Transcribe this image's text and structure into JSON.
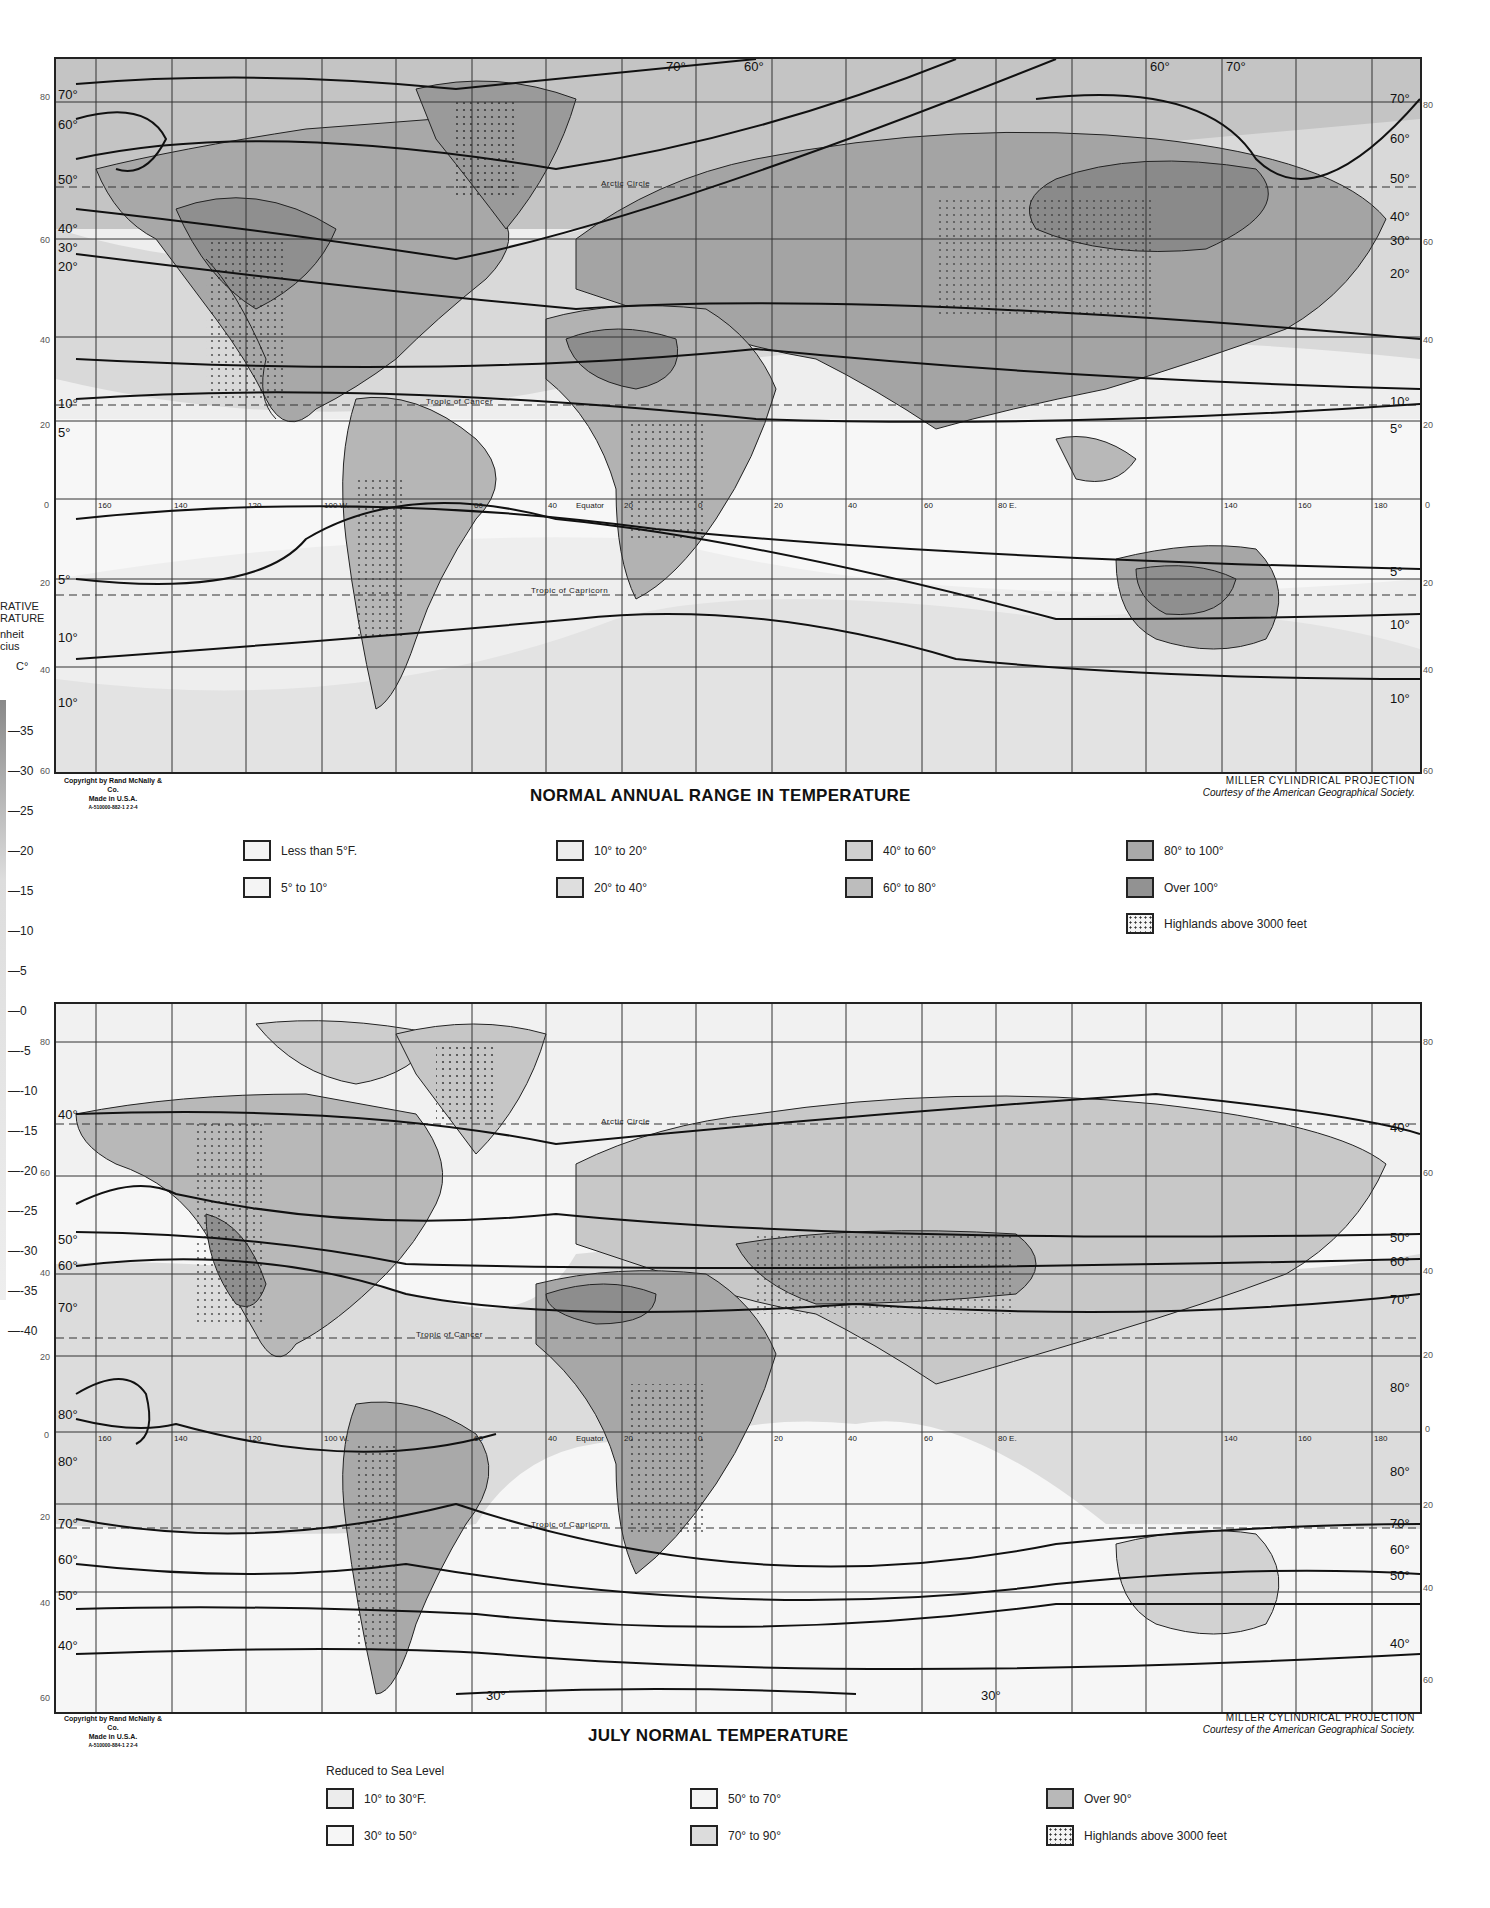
{
  "side_scale": {
    "header_lines": [
      "RATIVE",
      "RATURE",
      "nheit",
      "cius"
    ],
    "unit": "C°",
    "ticks": [
      "35",
      "30",
      "25",
      "20",
      "15",
      "10",
      "5",
      "0",
      "-5",
      "-10",
      "-15",
      "-20",
      "-25",
      "-30",
      "-35",
      "-40"
    ]
  },
  "colors": {
    "level_1": "#f4f4f4",
    "level_2": "#ececec",
    "level_3": "#dedede",
    "level_4": "#cfcfcf",
    "level_5": "#bdbdbd",
    "level_6": "#a9a9a9",
    "level_7": "#929292",
    "line": "#1a1a1a"
  },
  "maps": [
    {
      "title": "NORMAL ANNUAL RANGE IN TEMPERATURE",
      "copyright": [
        "Copyright by Rand McNally & Co.",
        "Made in U.S.A.",
        "A-510000-882-1 2 2-4"
      ],
      "projection": "MILLER CYLINDRICAL PROJECTION",
      "courtesy": "Courtesy of the American Geographical Society.",
      "lat_labels_left": [
        "80",
        "60",
        "40",
        "20",
        "0",
        "20",
        "40",
        "60"
      ],
      "lat_labels_right": [
        "80",
        "60",
        "40",
        "20",
        "0",
        "20",
        "40",
        "60"
      ],
      "lon_labels": [
        "160",
        "140",
        "120",
        "100 W.",
        "60",
        "40",
        "Equator",
        "20",
        "0",
        "20",
        "40",
        "60",
        "80 E.",
        "140",
        "160",
        "180"
      ],
      "reference_lines": {
        "arctic": "Arctic Circle",
        "cancer": "Tropic of Cancer",
        "capricorn": "Tropic of Capricorn"
      },
      "isotherm_labels_left": [
        "70°",
        "60°",
        "50°",
        "40°",
        "30°",
        "20°",
        "10°",
        "5°",
        "5°",
        "10°",
        "10°"
      ],
      "isotherm_labels_right": [
        "70°",
        "60°",
        "50°",
        "40°",
        "30°",
        "20°",
        "10°",
        "5°",
        "5°",
        "10°",
        "10°"
      ],
      "isotherm_labels_top": [
        "70°",
        "60°",
        "60°",
        "70°"
      ],
      "legend": [
        {
          "label": "Less than 5°F.",
          "level": 1
        },
        {
          "label": "5° to 10°",
          "level": 1
        },
        {
          "label": "10° to 20°",
          "level": 2
        },
        {
          "label": "20° to 40°",
          "level": 3
        },
        {
          "label": "40° to 60°",
          "level": 4
        },
        {
          "label": "60° to 80°",
          "level": 5
        },
        {
          "label": "80° to 100°",
          "level": 6
        },
        {
          "label": "Over 100°",
          "level": 7
        },
        {
          "label": "Highlands above 3000 feet",
          "level": "dots"
        }
      ]
    },
    {
      "title": "JULY NORMAL TEMPERATURE",
      "legend_subtitle": "Reduced to Sea Level",
      "copyright": [
        "Copyright by Rand McNally & Co.",
        "Made in U.S.A.",
        "A-510000-884-1 2 2-4"
      ],
      "projection": "MILLER CYLINDRICAL PROJECTION",
      "courtesy": "Courtesy of the American Geographical Society.",
      "lat_labels_left": [
        "80",
        "60",
        "40",
        "20",
        "0",
        "20",
        "40",
        "60"
      ],
      "lat_labels_right": [
        "80",
        "60",
        "40",
        "20",
        "0",
        "20",
        "40",
        "60"
      ],
      "lon_labels": [
        "160",
        "140",
        "120",
        "100 W.",
        "60",
        "40",
        "Equator",
        "20",
        "0",
        "20",
        "40",
        "60",
        "80 E.",
        "140",
        "160",
        "180"
      ],
      "reference_lines": {
        "arctic": "Arctic Circle",
        "cancer": "Tropic of Cancer",
        "capricorn": "Tropic of Capricorn"
      },
      "isotherm_labels_left": [
        "40°",
        "50°",
        "60°",
        "70°",
        "80°",
        "80°",
        "70°",
        "60°",
        "50°",
        "40°"
      ],
      "isotherm_labels_right": [
        "40°",
        "50°",
        "60°",
        "70°",
        "80°",
        "80°",
        "70°",
        "60°",
        "50°",
        "40°"
      ],
      "isotherm_labels_bottom": [
        "30°",
        "30°"
      ],
      "legend": [
        {
          "label": "10° to 30°F.",
          "level": 2
        },
        {
          "label": "30° to 50°",
          "level": 1
        },
        {
          "label": "50° to 70°",
          "level": 1
        },
        {
          "label": "70° to 90°",
          "level": 3
        },
        {
          "label": "Over 90°",
          "level": 5
        },
        {
          "label": "Highlands above 3000 feet",
          "level": "dots"
        }
      ]
    }
  ]
}
